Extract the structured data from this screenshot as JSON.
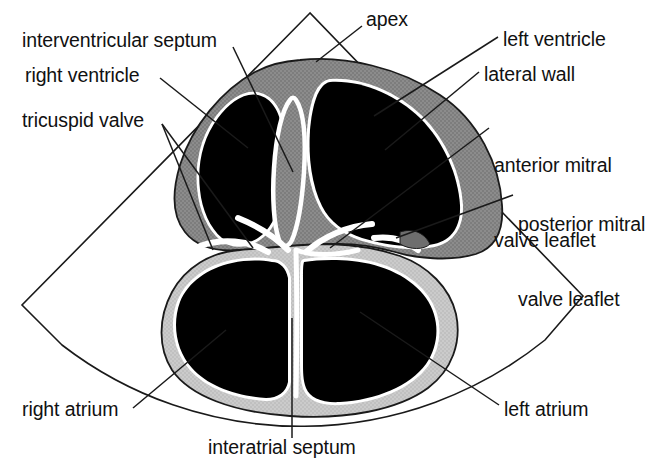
{
  "figure": {
    "type": "anatomical-line-diagram",
    "width": 666,
    "height": 472,
    "background_color": "#ffffff"
  },
  "colors": {
    "background": "#ffffff",
    "blood_pool": "#000000",
    "ventricular_myocardium": "#8c8c8c",
    "atrial_wall": "#c9c9c9",
    "endocardial_border": "#ffffff",
    "outline_stroke": "#1a1a1a",
    "label_text": "#111111",
    "leader_line": "#1a1a1a"
  },
  "labels": [
    {
      "id": "interventricular-septum",
      "text": "interventricular septum",
      "lines": [
        "interventricular septum"
      ],
      "x": 22,
      "y": 28,
      "side": "left"
    },
    {
      "id": "right-ventricle",
      "text": "right ventricle",
      "lines": [
        "right ventricle"
      ],
      "x": 25,
      "y": 63,
      "side": "left"
    },
    {
      "id": "tricuspid-valve",
      "text": "tricuspid valve",
      "lines": [
        "tricuspid valve"
      ],
      "x": 22,
      "y": 108,
      "side": "left"
    },
    {
      "id": "apex",
      "text": "apex",
      "lines": [
        "apex"
      ],
      "x": 366,
      "y": 7,
      "side": "top"
    },
    {
      "id": "left-ventricle",
      "text": "left ventricle",
      "lines": [
        "left ventricle"
      ],
      "x": 503,
      "y": 27,
      "side": "right"
    },
    {
      "id": "lateral-wall",
      "text": "lateral wall",
      "lines": [
        "lateral wall"
      ],
      "x": 484,
      "y": 62,
      "side": "right"
    },
    {
      "id": "anterior-mitral-valve-leaflet",
      "text": "anterior mitral valve leaflet",
      "lines": [
        "anterior mitral",
        "valve leaflet"
      ],
      "x": 494,
      "y": 103,
      "side": "right"
    },
    {
      "id": "posterior-mitral-valve-leaflet",
      "text": "posterior mitral valve leaflet",
      "lines": [
        "posterior mitral",
        "valve leaflet"
      ],
      "x": 518,
      "y": 162,
      "side": "right"
    },
    {
      "id": "right-atrium",
      "text": "right atrium",
      "lines": [
        "right atrium"
      ],
      "x": 22,
      "y": 397,
      "side": "left"
    },
    {
      "id": "left-atrium",
      "text": "left atrium",
      "lines": [
        "left atrium"
      ],
      "x": 504,
      "y": 397,
      "side": "right"
    },
    {
      "id": "interatrial-septum",
      "text": "interatrial septum",
      "lines": [
        "interatrial septum"
      ],
      "x": 208,
      "y": 435,
      "side": "bottom"
    }
  ],
  "structures": [
    {
      "id": "scan-sector",
      "name": "ultrasound scan sector outline",
      "fill": "none"
    },
    {
      "id": "ventricular-myocardium",
      "name": "ventricular myocardium",
      "fill": "#8c8c8c"
    },
    {
      "id": "atrial-wall",
      "name": "atrial wall",
      "fill": "#c9c9c9"
    },
    {
      "id": "right-ventricle-cavity",
      "name": "right ventricle cavity",
      "fill": "#000000"
    },
    {
      "id": "left-ventricle-cavity",
      "name": "left ventricle cavity",
      "fill": "#000000"
    },
    {
      "id": "right-atrium-cavity",
      "name": "right atrium cavity",
      "fill": "#000000"
    },
    {
      "id": "left-atrium-cavity",
      "name": "left atrium cavity",
      "fill": "#000000"
    },
    {
      "id": "interventricular-septum-band",
      "name": "interventricular septum",
      "fill": "#8c8c8c"
    },
    {
      "id": "tricuspid-valve-leaflets",
      "name": "tricuspid valve leaflets",
      "fill": "#ffffff"
    },
    {
      "id": "mitral-valve-leaflets",
      "name": "mitral valve leaflets",
      "fill": "#ffffff"
    },
    {
      "id": "interatrial-septum-line",
      "name": "interatrial septum",
      "fill": "#ffffff"
    }
  ]
}
